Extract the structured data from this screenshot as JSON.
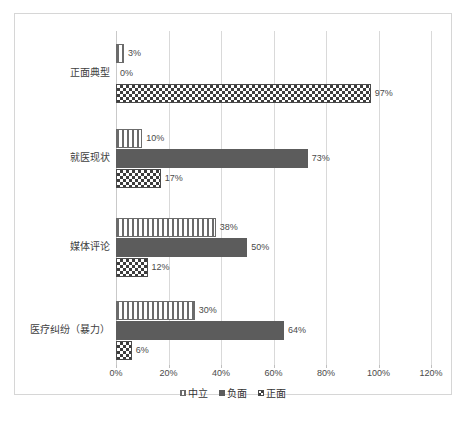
{
  "chart_data": {
    "type": "bar",
    "orientation": "horizontal",
    "title": "",
    "xlabel": "",
    "ylabel": "",
    "xlim": [
      0,
      120
    ],
    "xticks": [
      "0%",
      "20%",
      "40%",
      "60%",
      "80%",
      "100%",
      "120%"
    ],
    "xtick_values": [
      0,
      20,
      40,
      60,
      80,
      100,
      120
    ],
    "grid": true,
    "legend_position": "bottom",
    "categories": [
      "正面典型",
      "就医现状",
      "媒体评论",
      "医疗纠纷（暴力）"
    ],
    "series": [
      {
        "name": "中立",
        "pattern": "vertical-stripes",
        "color": "#6b6b6b",
        "values": [
          3,
          10,
          38,
          30
        ],
        "labels": [
          "3%",
          "10%",
          "38%",
          "30%"
        ]
      },
      {
        "name": "负面",
        "pattern": "solid",
        "color": "#5c5c5c",
        "values": [
          0,
          73,
          50,
          64
        ],
        "labels": [
          "0%",
          "73%",
          "50%",
          "64%"
        ]
      },
      {
        "name": "正面",
        "pattern": "checkerboard",
        "color": "#3d3d3d",
        "values": [
          97,
          17,
          12,
          6
        ],
        "labels": [
          "97%",
          "17%",
          "12%",
          "6%"
        ]
      }
    ]
  },
  "caption": ""
}
